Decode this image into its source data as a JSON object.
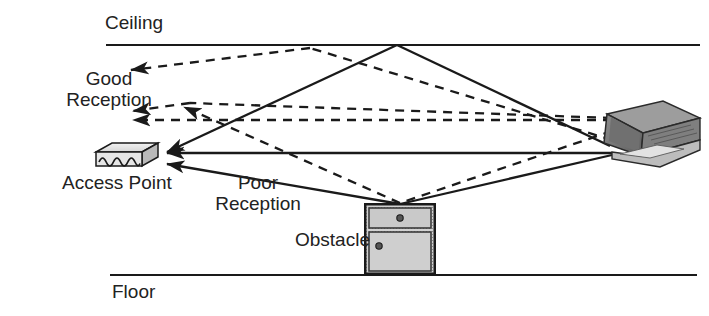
{
  "figure": {
    "background_color": "#ffffff",
    "line_color": "#1a1a1a",
    "text_color": "#222222"
  },
  "labels": {
    "ceiling": "Ceiling",
    "floor": "Floor",
    "good_reception": "Good\nReception",
    "poor_reception": "Poor\nReception",
    "access_point": "Access Point",
    "obstacle": "Obstacle"
  },
  "boundaries": [
    {
      "name": "ceiling-line",
      "x1": 106,
      "y1": 45,
      "x2": 700,
      "y2": 45
    },
    {
      "name": "floor-line",
      "x1": 110,
      "y1": 275,
      "x2": 697,
      "y2": 275
    }
  ],
  "devices": {
    "access_point": {
      "name": "access-point",
      "x": 88,
      "y": 146,
      "width": 66,
      "height": 26,
      "face_pattern": "wave-squiggle",
      "body_color": "#d8d8d8",
      "top_color": "#efefef"
    },
    "laptop": {
      "name": "laptop",
      "x": 592,
      "y": 101,
      "width": 108,
      "height": 66,
      "screen_color": "#6b6b6b",
      "base_color": "#9a9a9a"
    },
    "obstacle": {
      "name": "obstacle-cabinet",
      "x": 364,
      "y": 203,
      "width": 72,
      "height": 72,
      "fill_color": "#cfcfcf",
      "drawer_count": 2,
      "knob_count": 2
    }
  },
  "rays": {
    "solid_label": "Poor Reception path (solid)",
    "dashed_label": "Good Reception path (dashed)",
    "solid": [
      {
        "name": "ray-laptop-ceiling-ap",
        "points": "612,146 397,45 160,155",
        "arrow_at": "160,155"
      },
      {
        "name": "ray-laptop-direct-ap",
        "points": "612,152 160,152",
        "arrow_at": "160,152"
      },
      {
        "name": "ray-laptop-obstacle-ap",
        "points": "612,152 400,203 160,165",
        "arrow_at": "160,165"
      }
    ],
    "dashed": [
      {
        "name": "ray-laptop-ceiling-upper",
        "points": "612,140 310,48 126,72",
        "arrow_at": "126,72"
      },
      {
        "name": "ray-laptop-cross-mid",
        "points": "612,118 180,104 126,112",
        "arrow_at": "126,112"
      },
      {
        "name": "ray-laptop-horizontal",
        "points": "612,120 126,120",
        "arrow_at": "126,120"
      },
      {
        "name": "ray-obstacle-reflect-left",
        "points": "612,130 400,203 178,110",
        "arrow_at": "178,110"
      }
    ]
  }
}
